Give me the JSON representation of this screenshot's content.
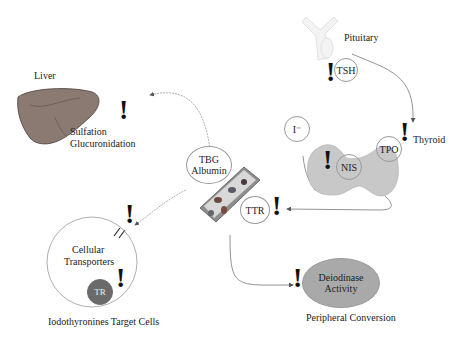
{
  "diagram": {
    "organs": {
      "pituitary": "Pituitary",
      "thyroid": "Thyroid",
      "liver": "Liver"
    },
    "liver_processes": [
      "Sulfation",
      "Glucuronidation"
    ],
    "circles": {
      "tsh": "TSH",
      "iodide": "I⁻",
      "nis": "NIS",
      "tpo": "TPO",
      "tbg_albumin_line1": "TBG",
      "tbg_albumin_line2": "Albumin",
      "ttr": "TTR",
      "tr": "TR",
      "deiodinase_line1": "Deiodinase",
      "deiodinase_line2": "Activity"
    },
    "cell": {
      "line1": "Cellular",
      "line2": "Transporters",
      "caption": "Iodothyronines Target Cells"
    },
    "peripheral_caption": "Peripheral Conversion",
    "disruption_marker": "!",
    "colors": {
      "thyroid_fill": "#c8c8c8",
      "deiodinase_fill": "#a9a9a9",
      "tr_fill": "#6a6a6a",
      "arrow": "#666666"
    }
  }
}
